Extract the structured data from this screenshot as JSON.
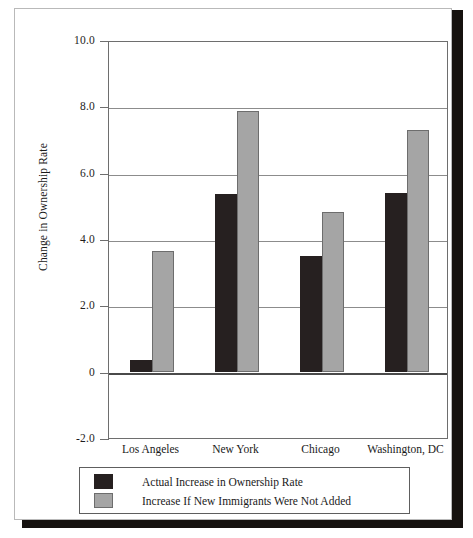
{
  "chart_data": {
    "type": "bar",
    "title": "",
    "xlabel": "",
    "ylabel": "Change in Ownership Rate",
    "ylim": [
      -2.0,
      10.0
    ],
    "ytick_labels": [
      "10.0",
      "8.0",
      "6.0",
      "4.0",
      "2.0",
      "0",
      "-2.0"
    ],
    "ytick_values": [
      10.0,
      8.0,
      6.0,
      4.0,
      2.0,
      0,
      -2.0
    ],
    "grid": true,
    "legend_position": "below-plot",
    "categories": [
      "Los Angeles",
      "New York",
      "Chicago",
      "Washington, DC"
    ],
    "series": [
      {
        "name": "Actual Increase in Ownership Rate",
        "color": "#262020",
        "values": [
          0.35,
          5.35,
          3.5,
          5.4
        ]
      },
      {
        "name": "Increase If New Immigrants Were Not Added",
        "color": "#a5a5a5",
        "values": [
          3.65,
          7.85,
          4.8,
          7.3
        ]
      }
    ]
  },
  "legend": {
    "items": [
      {
        "label": "Actual Increase in Ownership Rate",
        "swatch": "black-swatch"
      },
      {
        "label": "Increase If New Immigrants Were Not Added",
        "swatch": "gray-swatch"
      }
    ]
  }
}
